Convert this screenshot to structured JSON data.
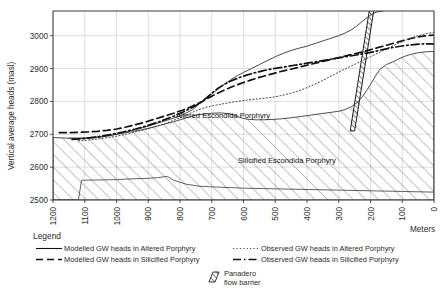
{
  "chart_data": {
    "type": "line",
    "title": "",
    "xlabel": "Meters",
    "ylabel": "Vertical average heads  (masl)",
    "xlim": [
      1200,
      0
    ],
    "ylim": [
      2500,
      3075
    ],
    "x_ticks": [
      "1200",
      "1100",
      "1000",
      "900",
      "800",
      "700",
      "600",
      "500",
      "400",
      "300",
      "200",
      "100",
      "0"
    ],
    "y_ticks": [
      "2500",
      "2600",
      "2700",
      "2800",
      "2900",
      "3000"
    ],
    "x_tick_values": [
      1200,
      1100,
      1000,
      900,
      800,
      700,
      600,
      500,
      400,
      300,
      200,
      100,
      0
    ],
    "y_tick_values": [
      2500,
      2600,
      2700,
      2800,
      2900,
      3000
    ],
    "grid": true,
    "x_axis_direction": "descending",
    "legend_position": "below-plot",
    "series": [
      {
        "name": "Modelled GW heads in Altered Porphyry",
        "style": "solid",
        "color": "#333333",
        "x": [
          1150,
          1120,
          1090,
          1060,
          1030,
          1000,
          970,
          940,
          910,
          880,
          850,
          820,
          790,
          760,
          745,
          730,
          715,
          700,
          690,
          675,
          660,
          640,
          620,
          600,
          575,
          550,
          525,
          500,
          475,
          450,
          425,
          400,
          375,
          350,
          325,
          300,
          280,
          260,
          245,
          230,
          215,
          200,
          190,
          180,
          170,
          160
        ],
        "y": [
          2688,
          2687,
          2688,
          2690,
          2694,
          2700,
          2707,
          2714,
          2722,
          2731,
          2740,
          2749,
          2760,
          2775,
          2788,
          2800,
          2812,
          2822,
          2830,
          2842,
          2852,
          2866,
          2878,
          2888,
          2900,
          2912,
          2924,
          2936,
          2946,
          2955,
          2962,
          2968,
          2976,
          2984,
          2992,
          3000,
          3008,
          3018,
          3028,
          3040,
          3052,
          3062,
          3068,
          3072,
          3074,
          3075
        ]
      },
      {
        "name": "Modelled GW heads in Silicified Porphyry",
        "style": "dashed",
        "color": "#111111",
        "x": [
          1180,
          1150,
          1120,
          1090,
          1060,
          1030,
          1000,
          970,
          940,
          910,
          880,
          850,
          820,
          790,
          760,
          730,
          700,
          670,
          640,
          610,
          580,
          550,
          520,
          490,
          460,
          430,
          400,
          370,
          340,
          310,
          280,
          250,
          220,
          190,
          160,
          130,
          100,
          70,
          40,
          10,
          0
        ],
        "y": [
          2705,
          2705,
          2706,
          2707,
          2709,
          2712,
          2716,
          2722,
          2729,
          2737,
          2746,
          2755,
          2764,
          2774,
          2786,
          2800,
          2816,
          2830,
          2843,
          2854,
          2864,
          2873,
          2881,
          2889,
          2896,
          2903,
          2910,
          2917,
          2924,
          2931,
          2938,
          2945,
          2952,
          2960,
          2968,
          2976,
          2984,
          2992,
          2998,
          3001,
          3002
        ]
      },
      {
        "name": "Observed GW heads in Altered Porphyry",
        "style": "dotted",
        "color": "#4a4a4a",
        "x": [
          1120,
          1080,
          1040,
          1000,
          960,
          920,
          880,
          840,
          800,
          770,
          740,
          710,
          680,
          650,
          620,
          590,
          560,
          530,
          500,
          470,
          440,
          410,
          380,
          350,
          320,
          290,
          260,
          230,
          200,
          170,
          140,
          110,
          80,
          50,
          20,
          0
        ],
        "y": [
          2680,
          2683,
          2688,
          2694,
          2702,
          2712,
          2722,
          2735,
          2750,
          2763,
          2775,
          2784,
          2790,
          2795,
          2800,
          2804,
          2807,
          2810,
          2814,
          2820,
          2828,
          2838,
          2850,
          2864,
          2879,
          2894,
          2908,
          2922,
          2936,
          2950,
          2964,
          2978,
          2990,
          3000,
          3007,
          3010
        ]
      },
      {
        "name": "Observed GW heads in Silicified Porphyry",
        "style": "dashdot",
        "color": "#111111",
        "x": [
          1140,
          1100,
          1060,
          1020,
          980,
          940,
          900,
          860,
          820,
          790,
          760,
          735,
          715,
          700,
          680,
          660,
          640,
          615,
          590,
          565,
          540,
          515,
          490,
          465,
          440,
          415,
          390,
          365,
          340,
          315,
          290,
          265,
          240,
          215,
          200,
          185,
          170,
          150,
          130,
          110,
          90,
          70,
          50,
          30,
          10,
          0
        ],
        "y": [
          2684,
          2687,
          2692,
          2699,
          2707,
          2716,
          2727,
          2740,
          2755,
          2768,
          2782,
          2796,
          2812,
          2825,
          2840,
          2852,
          2862,
          2872,
          2880,
          2887,
          2893,
          2898,
          2902,
          2906,
          2910,
          2914,
          2918,
          2922,
          2926,
          2930,
          2934,
          2938,
          2942,
          2946,
          2949,
          2952,
          2956,
          2960,
          2964,
          2967,
          2970,
          2972,
          2974,
          2975,
          2975,
          2975
        ]
      }
    ],
    "regions": [
      {
        "name": "Silicified Escondida Porphyry",
        "label": "Silicified Escondida Porphyry",
        "fill": "diagonal-hatch",
        "label_x": 420,
        "label_y": 2612
      },
      {
        "name": "Altered Escondida Porphyry",
        "label": "Altered Escondida Porphyry",
        "fill": "none",
        "label_x": 545,
        "label_y": 2767
      }
    ],
    "annotations": [
      {
        "text": "Altered Escondida Porphyry"
      },
      {
        "text": "Silicified Escondida Porphyry"
      }
    ],
    "barrier": {
      "name": "Panadero flow barrier",
      "fill": "diagonal-hatch",
      "x_top": 185,
      "x_bottom": 250,
      "y_top": 3075,
      "y_bottom": 2710
    }
  },
  "legend": {
    "title": "Legend",
    "entries": [
      {
        "label": "Modelled GW heads in Altered Porphyry",
        "style": "solid"
      },
      {
        "label": "Observed GW heads in Altered Porphyry",
        "style": "dotted"
      },
      {
        "label": "Modelled GW heads in Silicified Porphyry",
        "style": "dashed"
      },
      {
        "label": "Observed GW heads in Silicified Porphyry",
        "style": "dashdot"
      }
    ],
    "swatch": {
      "label_line1": "Panadero",
      "label_line2": "flow  barrier"
    }
  }
}
